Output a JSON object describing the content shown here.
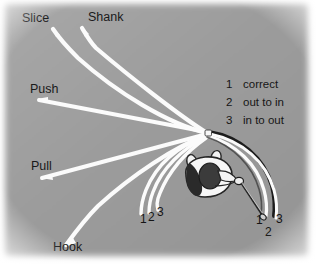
{
  "figure": {
    "background_color": "#9d9d9d",
    "trajectory_color": "#fbfbfb",
    "dark_path_color": "#1d1d1d",
    "text_color": "#171717",
    "ball_color": "#f4f4f4",
    "caption": "Golf ball flight directions and swing path diagram"
  },
  "shot_labels": [
    {
      "id": "slice",
      "text": "Slice",
      "x": 22,
      "y": 22
    },
    {
      "id": "shank",
      "text": "Shank",
      "x": 88,
      "y": 21
    },
    {
      "id": "push",
      "text": "Push",
      "x": 30,
      "y": 93
    },
    {
      "id": "pull",
      "text": "Pull",
      "x": 31,
      "y": 170
    },
    {
      "id": "hook",
      "text": "Hook",
      "x": 53,
      "y": 251
    }
  ],
  "legend": {
    "title": "",
    "items": [
      {
        "number": "1",
        "text": "correct"
      },
      {
        "number": "2",
        "text": "out to in"
      },
      {
        "number": "3",
        "text": "in to out"
      }
    ]
  },
  "path_numbers": {
    "left": [
      {
        "label": "1",
        "x": 142,
        "y": 222
      },
      {
        "label": "2",
        "x": 151,
        "y": 220
      },
      {
        "label": "3",
        "x": 160,
        "y": 216
      }
    ],
    "right": [
      {
        "label": "1",
        "x": 259,
        "y": 222
      },
      {
        "label": "2",
        "x": 268,
        "y": 234
      },
      {
        "label": "3",
        "x": 279,
        "y": 221
      }
    ]
  },
  "elements": {
    "ball": "golf-ball",
    "golfer": "golfer-top-view",
    "club": "golf-club",
    "target_line": "dotted-target-line"
  }
}
